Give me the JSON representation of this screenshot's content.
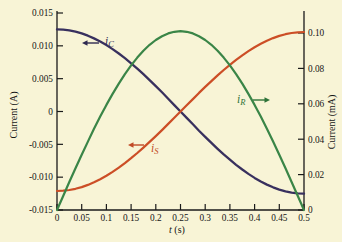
{
  "figure": {
    "background": "#f8f4d6"
  },
  "chart_data": {
    "type": "line",
    "axis_color": "#1a1a1a",
    "x_range": [
      0,
      0.5
    ],
    "xlabel_var": "t",
    "xlabel_unit": "(s)",
    "x_ticks": [
      {
        "v": 0,
        "label": "0"
      },
      {
        "v": 0.05,
        "label": "0.05"
      },
      {
        "v": 0.1,
        "label": "0.1"
      },
      {
        "v": 0.15,
        "label": "0.15"
      },
      {
        "v": 0.2,
        "label": "0.2"
      },
      {
        "v": 0.25,
        "label": "0.25"
      },
      {
        "v": 0.3,
        "label": "0.3"
      },
      {
        "v": 0.35,
        "label": "0.35"
      },
      {
        "v": 0.4,
        "label": "0.4"
      },
      {
        "v": 0.45,
        "label": "0.45"
      },
      {
        "v": 0.5,
        "label": "0.5"
      }
    ],
    "left_axis": {
      "label": "Current (A)",
      "range": [
        -0.015,
        0.015
      ],
      "ticks": [
        {
          "v": 0.015,
          "label": "0.015"
        },
        {
          "v": 0.01,
          "label": "0.010"
        },
        {
          "v": 0.005,
          "label": "0.005"
        },
        {
          "v": 0,
          "label": "0"
        },
        {
          "v": -0.005,
          "label": "-0.005"
        },
        {
          "v": -0.01,
          "label": "-0.010"
        },
        {
          "v": -0.015,
          "label": "-0.015"
        }
      ]
    },
    "right_axis": {
      "label": "Current (mA)",
      "range": [
        0,
        0.1113
      ],
      "ticks": [
        {
          "v": 0.1,
          "label": "0.10"
        },
        {
          "v": 0.08,
          "label": "0.08"
        },
        {
          "v": 0.06,
          "label": "0.06"
        },
        {
          "v": 0.04,
          "label": "0.04"
        },
        {
          "v": 0.02,
          "label": "0.02"
        },
        {
          "v": 0,
          "label": "0"
        }
      ]
    },
    "t": [
      0,
      0.0125,
      0.025,
      0.0375,
      0.05,
      0.0625,
      0.075,
      0.0875,
      0.1,
      0.1125,
      0.125,
      0.1375,
      0.15,
      0.1625,
      0.175,
      0.1875,
      0.2,
      0.2125,
      0.225,
      0.2375,
      0.25,
      0.2625,
      0.275,
      0.2875,
      0.3,
      0.3125,
      0.325,
      0.3375,
      0.35,
      0.3625,
      0.375,
      0.3875,
      0.4,
      0.4125,
      0.425,
      0.4375,
      0.45,
      0.4625,
      0.475,
      0.4875,
      0.5
    ],
    "series": [
      {
        "id": "iC",
        "axis": "left",
        "color": "#38305e",
        "width": 2.3,
        "values": [
          0.0125,
          0.012461,
          0.012346,
          0.012155,
          0.011888,
          0.011549,
          0.011138,
          0.010658,
          0.010113,
          0.009505,
          0.008839,
          0.008118,
          0.007347,
          0.006531,
          0.005675,
          0.004784,
          0.003863,
          0.002918,
          0.001955,
          0.000981,
          0,
          -0.000981,
          -0.001955,
          -0.002918,
          -0.003863,
          -0.004784,
          -0.005675,
          -0.006531,
          -0.007347,
          -0.008118,
          -0.008839,
          -0.009505,
          -0.010113,
          -0.010658,
          -0.011138,
          -0.011549,
          -0.011888,
          -0.012155,
          -0.012346,
          -0.012461,
          -0.0125
        ],
        "annotation": {
          "main": "i",
          "sub": "C",
          "color": "#2e2950",
          "text_x": 105,
          "text_y": 45,
          "arrow_dir": "left",
          "arrow_x": 82,
          "arrow_y": 43,
          "arrow_len": 17
        }
      },
      {
        "id": "iS",
        "axis": "left",
        "color": "#cc4e26",
        "width": 2.2,
        "values": [
          -0.0121,
          -0.012063,
          -0.011951,
          -0.011766,
          -0.011508,
          -0.011179,
          -0.010781,
          -0.010317,
          -0.009789,
          -0.009201,
          -0.008556,
          -0.007858,
          -0.007112,
          -0.006322,
          -0.005493,
          -0.00463,
          -0.003739,
          -0.002825,
          -0.001893,
          -0.000949,
          0,
          0.000949,
          0.001893,
          0.002825,
          0.003739,
          0.00463,
          0.005493,
          0.006322,
          0.007112,
          0.007858,
          0.008556,
          0.009201,
          0.009789,
          0.010317,
          0.010781,
          0.011179,
          0.011508,
          0.011766,
          0.011951,
          0.012063,
          0.0121
        ],
        "annotation": {
          "main": "i",
          "sub": "S",
          "color": "#c14a26",
          "text_x": 151,
          "text_y": 152,
          "arrow_dir": "left",
          "arrow_x": 128,
          "arrow_y": 145,
          "arrow_len": 16
        }
      },
      {
        "id": "iR",
        "axis": "right",
        "color": "#3a8547",
        "width": 2.2,
        "values": [
          0,
          0.007924,
          0.0158,
          0.023578,
          0.031211,
          0.038651,
          0.045853,
          0.052772,
          0.059366,
          0.065594,
          0.071418,
          0.076801,
          0.081711,
          0.086117,
          0.089992,
          0.093312,
          0.096057,
          0.098209,
          0.099756,
          0.100689,
          0.101,
          0.100689,
          0.099756,
          0.098209,
          0.096057,
          0.093312,
          0.089992,
          0.086117,
          0.081711,
          0.076801,
          0.071418,
          0.065594,
          0.059366,
          0.052772,
          0.045853,
          0.038651,
          0.031211,
          0.023578,
          0.0158,
          0.007924,
          0
        ],
        "annotation": {
          "main": "i",
          "sub": "R",
          "color": "#2e7339",
          "text_x": 237,
          "text_y": 103,
          "arrow_dir": "right",
          "arrow_x": 270,
          "arrow_y": 100,
          "arrow_len": 17
        }
      }
    ]
  }
}
